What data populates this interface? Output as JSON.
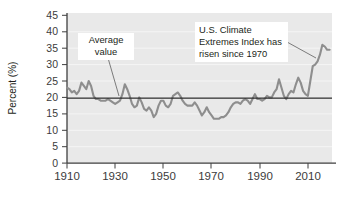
{
  "figure": {
    "name": "us-climate-extremes-index-chart",
    "plot_background": "#e9e9e9",
    "gridline_color": "#f4f4f4",
    "axis_color": "#3f3f3f",
    "series_color": "#8e8e8e",
    "average_line_color": "#2a2a2a",
    "callout_background": "#ffffff",
    "leader_line_color": "#6e6e6e"
  },
  "axes": {
    "ylabel": "Percent (%)",
    "yticks": [
      "0",
      "5",
      "10",
      "15",
      "20",
      "25",
      "30",
      "35",
      "40",
      "45"
    ],
    "xticks": [
      "1910",
      "1930",
      "1950",
      "1970",
      "1990",
      "2010"
    ]
  },
  "annotations": {
    "average": {
      "name": "average-value-callout",
      "lines": [
        "Average",
        "value"
      ],
      "line1": "Average",
      "line2": "value"
    },
    "trend": {
      "name": "trend-callout",
      "lines": [
        "U.S. Climate",
        "Extremes Index has",
        "risen since 1970"
      ],
      "line1": "U.S. Climate",
      "line2": "Extremes Index has",
      "line3": "risen since 1970"
    }
  },
  "chart_data": {
    "type": "line",
    "title": "",
    "xlabel": "",
    "ylabel": "Percent (%)",
    "xlim": [
      1910,
      2020
    ],
    "ylim": [
      0,
      45
    ],
    "grid": true,
    "legend": "none",
    "average_value": 19.8,
    "average_line_label": "Average value",
    "annotations": [
      {
        "text": "Average value",
        "points_to_year": 1927,
        "points_to_value": 19.8
      },
      {
        "text": "U.S. Climate Extremes Index has risen since 1970",
        "points_to_year": 2016,
        "points_to_value": 31.0
      }
    ],
    "series": [
      {
        "name": "U.S. Climate Extremes Index",
        "x": [
          1910,
          1911,
          1912,
          1913,
          1914,
          1915,
          1916,
          1917,
          1918,
          1919,
          1920,
          1921,
          1922,
          1923,
          1924,
          1925,
          1926,
          1927,
          1928,
          1929,
          1930,
          1931,
          1932,
          1933,
          1934,
          1935,
          1936,
          1937,
          1938,
          1939,
          1940,
          1941,
          1942,
          1943,
          1944,
          1945,
          1946,
          1947,
          1948,
          1949,
          1950,
          1951,
          1952,
          1953,
          1954,
          1955,
          1956,
          1957,
          1958,
          1959,
          1960,
          1961,
          1962,
          1963,
          1964,
          1965,
          1966,
          1967,
          1968,
          1969,
          1970,
          1971,
          1972,
          1973,
          1974,
          1975,
          1976,
          1977,
          1978,
          1979,
          1980,
          1981,
          1982,
          1983,
          1984,
          1985,
          1986,
          1987,
          1988,
          1989,
          1990,
          1991,
          1992,
          1993,
          1994,
          1995,
          1996,
          1997,
          1998,
          1999,
          2000,
          2001,
          2002,
          2003,
          2004,
          2005,
          2006,
          2007,
          2008,
          2009,
          2010,
          2011,
          2012,
          2013,
          2014,
          2015,
          2016,
          2017,
          2018,
          2019
        ],
        "values": [
          23.0,
          22.5,
          21.5,
          22.0,
          21.0,
          22.0,
          24.5,
          23.5,
          22.5,
          25.0,
          23.5,
          20.5,
          19.5,
          19.5,
          19.0,
          19.0,
          19.0,
          19.5,
          19.0,
          18.5,
          18.0,
          18.5,
          19.0,
          21.0,
          24.0,
          22.5,
          20.5,
          18.0,
          17.0,
          17.5,
          20.0,
          18.5,
          16.5,
          16.0,
          17.0,
          16.0,
          14.0,
          15.0,
          17.5,
          19.0,
          19.0,
          17.5,
          17.0,
          18.0,
          20.5,
          21.0,
          21.5,
          20.5,
          19.0,
          18.0,
          17.5,
          17.5,
          17.5,
          18.5,
          17.5,
          16.0,
          14.5,
          15.5,
          17.0,
          15.5,
          14.5,
          13.5,
          13.5,
          13.5,
          14.0,
          14.0,
          14.5,
          15.5,
          17.0,
          18.0,
          18.5,
          18.5,
          18.0,
          19.0,
          19.5,
          19.0,
          18.0,
          19.5,
          21.0,
          19.5,
          19.5,
          19.0,
          19.5,
          20.5,
          20.0,
          20.0,
          21.5,
          22.5,
          25.5,
          23.0,
          20.5,
          19.5,
          21.0,
          22.0,
          21.5,
          24.0,
          26.0,
          24.5,
          22.0,
          21.0,
          20.5,
          25.0,
          29.5,
          30.0,
          31.0,
          33.0,
          36.0,
          35.5,
          34.5,
          34.5
        ]
      }
    ]
  }
}
